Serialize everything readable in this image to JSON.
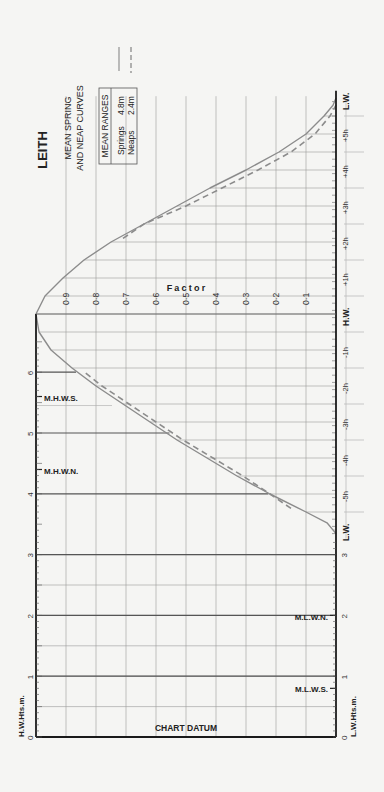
{
  "header": {
    "station": "LEITH",
    "subtitle_line1": "MEAN SPRING",
    "subtitle_line2": "AND NEAP CURVES",
    "legend_box_title": "MEAN RANGES",
    "springs_label": "Springs",
    "springs_value": "4.8m",
    "neaps_label": "Neaps",
    "neaps_value": "2.4m"
  },
  "labels": {
    "factor_axis": "Factor",
    "chart_datum": "CHART DATUM",
    "hw_heights": "H.W.Hts.m.",
    "lw_heights": "L.W.Hts.m.",
    "hw": "H.W.",
    "lw_top": "L.W.",
    "lw_bottom": "L.W.",
    "mhws": "M.H.W.S.",
    "mhwn": "M.H.W.N.",
    "mlwn": "M.L.W.N.",
    "mlws": "M.L.W.S."
  },
  "colors": {
    "curve": "#8c8c8c",
    "grid": "#9a9a9a",
    "axis": "#1a1a1a",
    "height_line": "#555555",
    "text": "#222222"
  },
  "chart_data": {
    "type": "line",
    "orientation": "rotated 90° counter-clockwise (time runs vertically, factor horizontally)",
    "xlabel": "Time from H.W. (hours)",
    "ylabel": "Factor",
    "factor_ticks": [
      "0·1",
      "0·2",
      "0·3",
      "0·4",
      "0·5",
      "0·6",
      "0·7",
      "0·8",
      "0·9"
    ],
    "factor_range": [
      0,
      1
    ],
    "time_ticks": [
      "-6h (L.W.)",
      "-5h",
      "-4h",
      "-3h",
      "-2h",
      "-1h",
      "H.W.",
      "+1h",
      "+2h",
      "+3h",
      "+4h",
      "+5h",
      "+6h (L.W.)"
    ],
    "time_tick_labels": [
      "-5h",
      "-4h",
      "-3h",
      "-2h",
      "-1h",
      "+1h",
      "+2h",
      "+3h",
      "+4h",
      "+5h"
    ],
    "height_axis_hw": {
      "label": "H.W.Hts.m.",
      "ticks": [
        "0",
        "1",
        "2",
        "3",
        "4",
        "5",
        "6"
      ],
      "range": [
        0,
        6.5
      ]
    },
    "height_axis_lw": {
      "label": "L.W.Hts.m.",
      "ticks": [
        "0",
        "1",
        "2",
        "3"
      ]
    },
    "annotations": {
      "MHWS": 5.6,
      "MHWN": 4.4,
      "MLWN": 2.0,
      "MLWS": 0.8
    },
    "mean_ranges": {
      "springs_m": 4.8,
      "neaps_m": 2.4
    },
    "series": [
      {
        "name": "Springs (solid)",
        "x": [
          -6.1,
          -5.8,
          -5.5,
          -5.0,
          -4.5,
          -4.0,
          -3.5,
          -3.0,
          -2.5,
          -2.0,
          -1.5,
          -1.0,
          -0.5,
          0,
          0.5,
          1.0,
          1.5,
          2.0,
          2.5,
          3.0,
          3.5,
          4.0,
          4.5,
          5.0,
          5.5,
          5.8,
          6.0
        ],
        "values": [
          0.0,
          0.03,
          0.1,
          0.22,
          0.33,
          0.43,
          0.53,
          0.62,
          0.71,
          0.8,
          0.88,
          0.95,
          0.99,
          1.0,
          0.97,
          0.91,
          0.84,
          0.75,
          0.64,
          0.53,
          0.42,
          0.3,
          0.19,
          0.1,
          0.04,
          0.01,
          0.0
        ]
      },
      {
        "name": "Neaps (dashed)",
        "x": [
          -5.4,
          -5.0,
          -4.5,
          -4.0,
          -3.5,
          -3.0,
          -2.5,
          -2.0,
          -1.6,
          2.1,
          2.5,
          3.0,
          3.5,
          4.0,
          4.5,
          5.0,
          5.5,
          5.8
        ],
        "values": [
          0.15,
          0.22,
          0.31,
          0.41,
          0.51,
          0.6,
          0.69,
          0.78,
          0.84,
          0.71,
          0.64,
          0.5,
          0.38,
          0.26,
          0.15,
          0.07,
          0.02,
          0.0
        ]
      }
    ],
    "grid": true,
    "legend": {
      "position": "top-left (rotated)",
      "entries": [
        "Springs 4.8m (solid)",
        "Neaps 2.4m (dashed)"
      ]
    }
  }
}
